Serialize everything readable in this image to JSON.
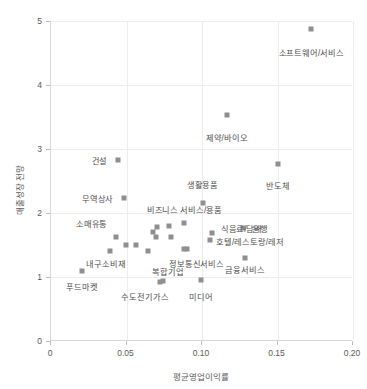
{
  "chart_data": {
    "type": "scatter",
    "title": "",
    "xlabel": "평균영업이익률",
    "ylabel": "매출성장 전망",
    "xlim": [
      0,
      0.2
    ],
    "ylim": [
      0,
      5
    ],
    "grid": true,
    "legend": "none",
    "marker_color": "#8f8f8f",
    "xticks": [
      "0",
      "0.05",
      "0.10",
      "0.15",
      "0.20"
    ],
    "xtick_values": [
      0,
      0.05,
      0.1,
      0.15,
      0.2
    ],
    "yticks": [
      "0",
      "1",
      "2",
      "3",
      "4",
      "5"
    ],
    "ytick_values": [
      0,
      1,
      2,
      3,
      4,
      5
    ],
    "points": [
      {
        "label": "소프트웨어/서비스",
        "x": 0.173,
        "y": 4.88,
        "lx": 0.173,
        "ly": 4.52,
        "anchor": "mid"
      },
      {
        "label": "제약/바이오",
        "x": 0.117,
        "y": 3.53,
        "lx": 0.117,
        "ly": 3.18,
        "anchor": "mid"
      },
      {
        "label": "건설",
        "x": 0.045,
        "y": 2.83,
        "lx": 0.038,
        "ly": 2.83,
        "anchor": "end"
      },
      {
        "label": "반도체",
        "x": 0.151,
        "y": 2.77,
        "lx": 0.151,
        "ly": 2.43,
        "anchor": "mid"
      },
      {
        "label": "무역상사",
        "x": 0.049,
        "y": 2.23,
        "lx": 0.042,
        "ly": 2.23,
        "anchor": "end"
      },
      {
        "label": "생활용품",
        "x": 0.101,
        "y": 2.16,
        "lx": 0.101,
        "ly": 2.45,
        "anchor": "mid"
      },
      {
        "label": "비즈니스 서비스/용품",
        "x": 0.089,
        "y": 1.84,
        "lx": 0.089,
        "ly": 2.06,
        "anchor": "mid"
      },
      {
        "label": "은행",
        "x": 0.128,
        "y": 1.77,
        "lx": 0.134,
        "ly": 1.77,
        "anchor": "start"
      },
      {
        "label": "식음료/담배",
        "x": 0.107,
        "y": 1.68,
        "lx": 0.113,
        "ly": 1.77,
        "anchor": "start"
      },
      {
        "label": "소매유통",
        "x": 0.044,
        "y": 1.62,
        "lx": 0.038,
        "ly": 1.85,
        "anchor": "end"
      },
      {
        "label": "호텔/레스토랑/레저",
        "x": 0.106,
        "y": 1.58,
        "lx": 0.11,
        "ly": 1.56,
        "anchor": "start"
      },
      {
        "label": "내구소비재",
        "x": 0.04,
        "y": 1.4,
        "lx": 0.05,
        "ly": 1.22,
        "anchor": "end"
      },
      {
        "label": "금융서비스",
        "x": 0.129,
        "y": 1.3,
        "lx": 0.129,
        "ly": 1.13,
        "anchor": "mid"
      },
      {
        "label": "정보통신서비스",
        "x": 0.091,
        "y": 1.44,
        "lx": 0.097,
        "ly": 1.22,
        "anchor": "mid"
      },
      {
        "label": "복합기업",
        "x": 0.075,
        "y": 0.93,
        "lx": 0.078,
        "ly": 1.1,
        "anchor": "mid"
      },
      {
        "label": "푸드마켓",
        "x": 0.021,
        "y": 1.1,
        "lx": 0.021,
        "ly": 0.86,
        "anchor": "mid"
      },
      {
        "label": "수도전기가스",
        "x": 0.073,
        "y": 0.92,
        "lx": 0.063,
        "ly": 0.71,
        "anchor": "mid"
      },
      {
        "label": "미디어",
        "x": 0.1,
        "y": 0.95,
        "lx": 0.1,
        "ly": 0.7,
        "anchor": "mid"
      },
      {
        "label": "",
        "x": 0.05,
        "y": 1.5,
        "lx": 0,
        "ly": 0,
        "anchor": "mid"
      },
      {
        "label": "",
        "x": 0.057,
        "y": 1.5,
        "lx": 0,
        "ly": 0,
        "anchor": "mid"
      },
      {
        "label": "",
        "x": 0.065,
        "y": 1.41,
        "lx": 0,
        "ly": 0,
        "anchor": "mid"
      },
      {
        "label": "",
        "x": 0.068,
        "y": 1.7,
        "lx": 0,
        "ly": 0,
        "anchor": "mid"
      },
      {
        "label": "",
        "x": 0.07,
        "y": 1.62,
        "lx": 0,
        "ly": 0,
        "anchor": "mid"
      },
      {
        "label": "",
        "x": 0.079,
        "y": 1.8,
        "lx": 0,
        "ly": 0,
        "anchor": "mid"
      },
      {
        "label": "",
        "x": 0.08,
        "y": 1.63,
        "lx": 0,
        "ly": 0,
        "anchor": "mid"
      },
      {
        "label": "",
        "x": 0.071,
        "y": 1.78,
        "lx": 0,
        "ly": 0,
        "anchor": "mid"
      },
      {
        "label": "",
        "x": 0.089,
        "y": 1.43,
        "lx": 0,
        "ly": 0,
        "anchor": "mid"
      }
    ]
  }
}
